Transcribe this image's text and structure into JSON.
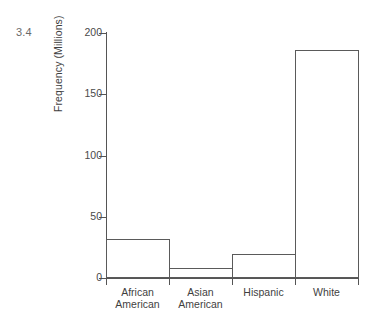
{
  "figure": {
    "number": "3.4"
  },
  "chart_data": {
    "type": "bar",
    "title": "",
    "xlabel": "",
    "ylabel": "Frequency (Millions)",
    "categories": [
      "African\nAmerican",
      "Asian\nAmerican",
      "Hispanic",
      "White"
    ],
    "category_labels_flat": [
      "African American",
      "Asian American",
      "Hispanic",
      "White"
    ],
    "values": [
      32,
      8,
      20,
      186
    ],
    "ylim": [
      0,
      200
    ],
    "yticks": [
      0,
      50,
      100,
      150,
      200
    ],
    "ytick_labels": [
      "0",
      "50",
      "100",
      "150",
      "200"
    ],
    "grid": false,
    "legend": false,
    "bar_style": {
      "fill": "#ffffff",
      "edge": "#5a5a5a"
    },
    "axis_color": "#555555",
    "text_color": "#3f3f3f",
    "background": "#ffffff"
  }
}
